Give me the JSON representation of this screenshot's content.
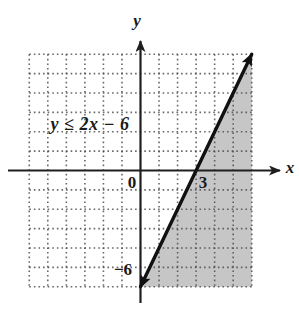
{
  "figure": {
    "inequality_label": "y ≤ 2x − 6",
    "axis_labels": {
      "x": "x",
      "y": "y"
    },
    "origin_label": "0",
    "x_intercept_label": "3",
    "y_intercept_label": "−6"
  },
  "colors": {
    "background": "#ffffff",
    "shading": "#c6c6c6",
    "grid_dots": "#4a4a4a",
    "axis": "#1f1f1f",
    "line": "#111111",
    "text": "#1a1a1a"
  },
  "chart_data": {
    "type": "line",
    "inequality": "y ≤ 2x − 6",
    "xlabel": "x",
    "ylabel": "y",
    "xlim": [
      -6,
      6
    ],
    "ylim": [
      -6,
      6
    ],
    "grid": {
      "style": "dotted",
      "spacing": 1
    },
    "boundary_line": {
      "equation": "y = 2x − 6",
      "slope": 2,
      "y_intercept": -6,
      "x_intercept": 3,
      "style": "solid",
      "arrows": "both-ends",
      "segment": [
        [
          0,
          -6
        ],
        [
          6,
          6
        ]
      ]
    },
    "shaded_region": {
      "description": "half-plane below/right of the boundary line (solutions of y ≤ 2x − 6), clipped to the grid",
      "polygon": [
        [
          0,
          -6
        ],
        [
          6,
          6
        ],
        [
          6,
          -6
        ]
      ]
    },
    "tick_labels": [
      {
        "text": "0",
        "position": "origin"
      },
      {
        "text": "3",
        "position": "x-intercept on x-axis"
      },
      {
        "text": "−6",
        "position": "y-intercept on y-axis"
      }
    ]
  }
}
